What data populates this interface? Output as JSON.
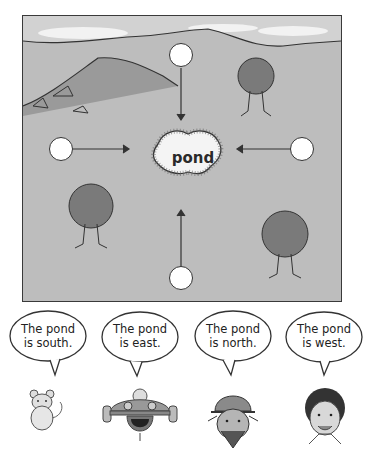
{
  "map": {
    "center_label": "pond",
    "circles": [
      {
        "position": "north"
      },
      {
        "position": "west"
      },
      {
        "position": "east"
      },
      {
        "position": "south"
      }
    ],
    "colors": {
      "ground": "#bdbdbd",
      "sky": "#cfcfcf",
      "tree": "#7a7a7a",
      "border": "#3a3a3a"
    }
  },
  "bubbles": [
    {
      "line1": "The pond",
      "line2": "is south.",
      "speaker": "mouse"
    },
    {
      "line1": "The pond",
      "line2": "is east.",
      "speaker": "robot"
    },
    {
      "line1": "The pond",
      "line2": "is north.",
      "speaker": "man-with-cap"
    },
    {
      "line1": "The pond",
      "line2": "is west.",
      "speaker": "girl"
    }
  ]
}
